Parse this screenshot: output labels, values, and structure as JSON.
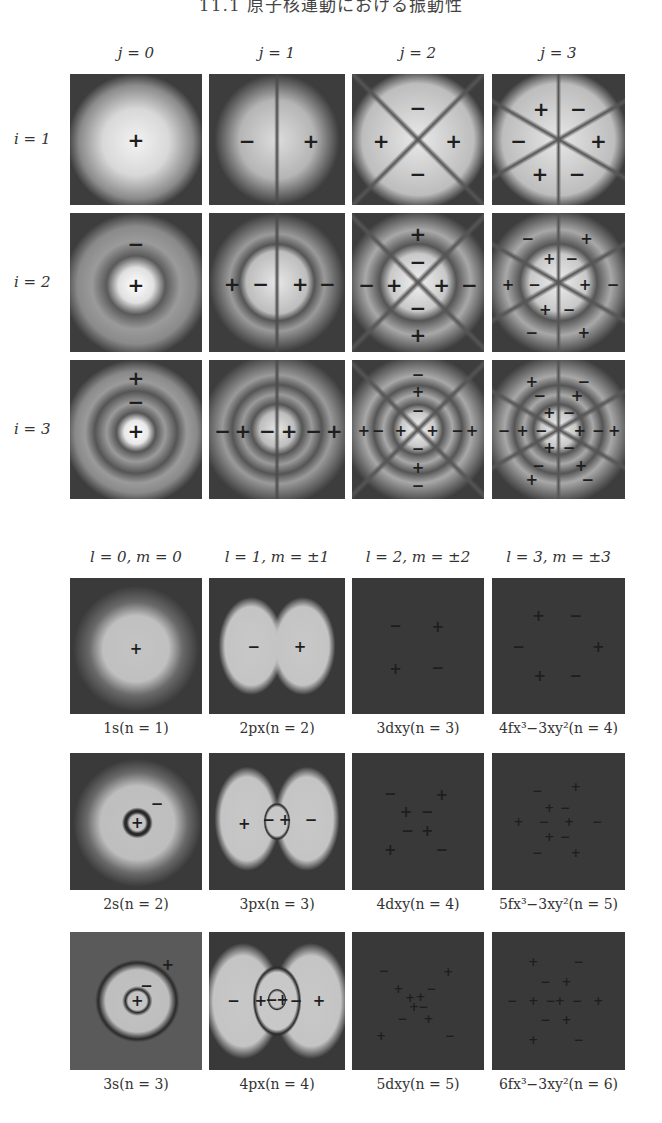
{
  "header": {
    "title": "11.1 原子核運動における振動性"
  },
  "top_section": {
    "columns": [
      "j = 0",
      "j = 1",
      "j = 2",
      "j = 3"
    ],
    "rows": [
      "i = 1",
      "i = 2",
      "i = 3"
    ],
    "panels": [
      [
        {
          "pattern": "j0i1",
          "signs": [
            {
              "s": "+",
              "x": 50,
              "y": 50
            }
          ]
        },
        {
          "pattern": "j1i1",
          "signs": [
            {
              "s": "−",
              "x": 28,
              "y": 51
            },
            {
              "s": "+",
              "x": 75,
              "y": 51
            }
          ]
        },
        {
          "pattern": "j2i1",
          "signs": [
            {
              "s": "−",
              "x": 50,
              "y": 26
            },
            {
              "s": "+",
              "x": 22,
              "y": 51
            },
            {
              "s": "+",
              "x": 77,
              "y": 51
            },
            {
              "s": "−",
              "x": 50,
              "y": 76
            }
          ]
        },
        {
          "pattern": "j3i1",
          "signs": [
            {
              "s": "+",
              "x": 37,
              "y": 27
            },
            {
              "s": "−",
              "x": 65,
              "y": 27
            },
            {
              "s": "−",
              "x": 20,
              "y": 51
            },
            {
              "s": "+",
              "x": 80,
              "y": 51
            },
            {
              "s": "+",
              "x": 36,
              "y": 76
            },
            {
              "s": "−",
              "x": 64,
              "y": 76
            }
          ]
        }
      ],
      [
        {
          "pattern": "j0i2",
          "signs": [
            {
              "s": "−",
              "x": 50,
              "y": 22
            },
            {
              "s": "+",
              "x": 50,
              "y": 52
            }
          ]
        },
        {
          "pattern": "j1i2",
          "signs": [
            {
              "s": "+",
              "x": 17,
              "y": 51
            },
            {
              "s": "−",
              "x": 38,
              "y": 51
            },
            {
              "s": "+",
              "x": 67,
              "y": 51
            },
            {
              "s": "−",
              "x": 87,
              "y": 51
            }
          ]
        },
        {
          "pattern": "j2i2",
          "signs": [
            {
              "s": "+",
              "x": 50,
              "y": 15
            },
            {
              "s": "−",
              "x": 50,
              "y": 35
            },
            {
              "s": "−",
              "x": 11,
              "y": 52
            },
            {
              "s": "+",
              "x": 32,
              "y": 52
            },
            {
              "s": "+",
              "x": 68,
              "y": 52
            },
            {
              "s": "−",
              "x": 89,
              "y": 52
            },
            {
              "s": "−",
              "x": 50,
              "y": 68
            },
            {
              "s": "+",
              "x": 50,
              "y": 88
            }
          ]
        },
        {
          "pattern": "j3i2",
          "signs": [
            {
              "s": "−",
              "x": 27,
              "y": 19
            },
            {
              "s": "+",
              "x": 71,
              "y": 19
            },
            {
              "s": "+",
              "x": 43,
              "y": 33
            },
            {
              "s": "−",
              "x": 60,
              "y": 33
            },
            {
              "s": "+",
              "x": 12,
              "y": 52
            },
            {
              "s": "−",
              "x": 32,
              "y": 52
            },
            {
              "s": "+",
              "x": 70,
              "y": 52
            },
            {
              "s": "−",
              "x": 91,
              "y": 52
            },
            {
              "s": "+",
              "x": 40,
              "y": 70
            },
            {
              "s": "−",
              "x": 58,
              "y": 70
            },
            {
              "s": "−",
              "x": 30,
              "y": 86
            },
            {
              "s": "+",
              "x": 69,
              "y": 86
            }
          ]
        }
      ],
      [
        {
          "pattern": "j0i3",
          "signs": [
            {
              "s": "+",
              "x": 50,
              "y": 13
            },
            {
              "s": "−",
              "x": 50,
              "y": 30
            },
            {
              "s": "+",
              "x": 50,
              "y": 51
            }
          ]
        },
        {
          "pattern": "j1i3",
          "signs": [
            {
              "s": "−",
              "x": 10,
              "y": 51
            },
            {
              "s": "+",
              "x": 25,
              "y": 51
            },
            {
              "s": "−",
              "x": 43,
              "y": 51
            },
            {
              "s": "+",
              "x": 59,
              "y": 51
            },
            {
              "s": "−",
              "x": 77,
              "y": 51
            },
            {
              "s": "+",
              "x": 92,
              "y": 51
            }
          ]
        },
        {
          "pattern": "j3i2b",
          "signs": [
            {
              "s": "−",
              "x": 50,
              "y": 11
            },
            {
              "s": "+",
              "x": 50,
              "y": 23
            },
            {
              "s": "−",
              "x": 50,
              "y": 37
            },
            {
              "s": "+",
              "x": 9,
              "y": 51
            },
            {
              "s": "−",
              "x": 20,
              "y": 51
            },
            {
              "s": "+",
              "x": 37,
              "y": 51
            },
            {
              "s": "+",
              "x": 61,
              "y": 51
            },
            {
              "s": "−",
              "x": 80,
              "y": 51
            },
            {
              "s": "+",
              "x": 91,
              "y": 51
            },
            {
              "s": "−",
              "x": 50,
              "y": 64
            },
            {
              "s": "+",
              "x": 50,
              "y": 78
            },
            {
              "s": "−",
              "x": 50,
              "y": 91
            }
          ]
        },
        {
          "pattern": "j3i3",
          "signs": [
            {
              "s": "+",
              "x": 30,
              "y": 16
            },
            {
              "s": "−",
              "x": 69,
              "y": 16
            },
            {
              "s": "−",
              "x": 36,
              "y": 26
            },
            {
              "s": "+",
              "x": 64,
              "y": 26
            },
            {
              "s": "+",
              "x": 43,
              "y": 38
            },
            {
              "s": "−",
              "x": 58,
              "y": 38
            },
            {
              "s": "−",
              "x": 9,
              "y": 51
            },
            {
              "s": "+",
              "x": 23,
              "y": 51
            },
            {
              "s": "−",
              "x": 37,
              "y": 51
            },
            {
              "s": "+",
              "x": 66,
              "y": 51
            },
            {
              "s": "−",
              "x": 80,
              "y": 51
            },
            {
              "s": "+",
              "x": 92,
              "y": 51
            },
            {
              "s": "+",
              "x": 43,
              "y": 63
            },
            {
              "s": "−",
              "x": 58,
              "y": 63
            },
            {
              "s": "−",
              "x": 35,
              "y": 76
            },
            {
              "s": "+",
              "x": 67,
              "y": 76
            },
            {
              "s": "+",
              "x": 30,
              "y": 86
            },
            {
              "s": "−",
              "x": 72,
              "y": 86
            }
          ]
        }
      ]
    ]
  },
  "bottom_section": {
    "columns": [
      "l = 0,  m = 0",
      "l = 1,  m = ±1",
      "l = 2,  m = ±2",
      "l = 3,  m = ±3"
    ],
    "rows": [
      [
        {
          "caption": "1s(n = 1)",
          "pattern": "s1",
          "signs": [
            {
              "s": "+",
              "x": 50,
              "y": 52
            }
          ]
        },
        {
          "caption": "2px(n = 2)",
          "pattern": "p1",
          "signs": [
            {
              "s": "−",
              "x": 33,
              "y": 51
            },
            {
              "s": "+",
              "x": 67,
              "y": 51
            }
          ]
        },
        {
          "caption": "3dxy(n = 3)",
          "pattern": "d1",
          "signs": [
            {
              "s": "−",
              "x": 33,
              "y": 35
            },
            {
              "s": "+",
              "x": 65,
              "y": 36
            },
            {
              "s": "+",
              "x": 33,
              "y": 67
            },
            {
              "s": "−",
              "x": 65,
              "y": 66
            }
          ]
        },
        {
          "caption": "4fx³−3xy²(n = 4)",
          "pattern": "f1",
          "signs": [
            {
              "s": "+",
              "x": 35,
              "y": 28
            },
            {
              "s": "−",
              "x": 63,
              "y": 28
            },
            {
              "s": "−",
              "x": 20,
              "y": 51
            },
            {
              "s": "+",
              "x": 80,
              "y": 51
            },
            {
              "s": "+",
              "x": 36,
              "y": 72
            },
            {
              "s": "−",
              "x": 63,
              "y": 72
            }
          ]
        }
      ],
      [
        {
          "caption": "2s(n = 2)",
          "pattern": "s2",
          "signs": [
            {
              "s": "−",
              "x": 66,
              "y": 37
            },
            {
              "s": "+",
              "x": 51,
              "y": 51
            }
          ]
        },
        {
          "caption": "3px(n = 3)",
          "pattern": "p2",
          "signs": [
            {
              "s": "+",
              "x": 26,
              "y": 52
            },
            {
              "s": "−",
              "x": 44,
              "y": 49
            },
            {
              "s": "+",
              "x": 56,
              "y": 49
            },
            {
              "s": "−",
              "x": 75,
              "y": 49
            }
          ]
        },
        {
          "caption": "4dxy(n = 4)",
          "pattern": "d2",
          "signs": [
            {
              "s": "−",
              "x": 29,
              "y": 30
            },
            {
              "s": "+",
              "x": 68,
              "y": 31
            },
            {
              "s": "+",
              "x": 41,
              "y": 43
            },
            {
              "s": "−",
              "x": 57,
              "y": 43
            },
            {
              "s": "−",
              "x": 42,
              "y": 57
            },
            {
              "s": "+",
              "x": 57,
              "y": 57
            },
            {
              "s": "+",
              "x": 29,
              "y": 71
            },
            {
              "s": "−",
              "x": 68,
              "y": 71
            }
          ]
        },
        {
          "caption": "5fx³−3xy²(n = 5)",
          "pattern": "f2",
          "signs": [
            {
              "s": "−",
              "x": 34,
              "y": 28
            },
            {
              "s": "+",
              "x": 63,
              "y": 25
            },
            {
              "s": "+",
              "x": 43,
              "y": 40
            },
            {
              "s": "−",
              "x": 55,
              "y": 40
            },
            {
              "s": "+",
              "x": 20,
              "y": 50
            },
            {
              "s": "−",
              "x": 39,
              "y": 50
            },
            {
              "s": "+",
              "x": 58,
              "y": 50
            },
            {
              "s": "−",
              "x": 79,
              "y": 50
            },
            {
              "s": "+",
              "x": 43,
              "y": 61
            },
            {
              "s": "−",
              "x": 55,
              "y": 61
            },
            {
              "s": "−",
              "x": 34,
              "y": 73
            },
            {
              "s": "+",
              "x": 63,
              "y": 73
            }
          ]
        }
      ],
      [
        {
          "caption": "3s(n = 3)",
          "pattern": "s3",
          "signs": [
            {
              "s": "+",
              "x": 74,
              "y": 24
            },
            {
              "s": "−",
              "x": 58,
              "y": 39
            },
            {
              "s": "+",
              "x": 51,
              "y": 50
            }
          ]
        },
        {
          "caption": "4px(n = 4)",
          "pattern": "p3",
          "signs": [
            {
              "s": "−",
              "x": 18,
              "y": 50
            },
            {
              "s": "+",
              "x": 38,
              "y": 50
            },
            {
              "s": "−",
              "x": 46,
              "y": 49
            },
            {
              "s": "+",
              "x": 54,
              "y": 49
            },
            {
              "s": "−",
              "x": 64,
              "y": 50
            },
            {
              "s": "+",
              "x": 81,
              "y": 50
            }
          ]
        },
        {
          "caption": "5dxy(n = 5)",
          "pattern": "d3",
          "signs": [
            {
              "s": "−",
              "x": 24,
              "y": 28
            },
            {
              "s": "+",
              "x": 73,
              "y": 29
            },
            {
              "s": "+",
              "x": 35,
              "y": 41
            },
            {
              "s": "−",
              "x": 60,
              "y": 41
            },
            {
              "s": "+",
              "x": 44,
              "y": 48
            },
            {
              "s": "+",
              "x": 52,
              "y": 47
            },
            {
              "s": "+",
              "x": 47,
              "y": 54
            },
            {
              "s": "−",
              "x": 54,
              "y": 54
            },
            {
              "s": "−",
              "x": 38,
              "y": 63
            },
            {
              "s": "+",
              "x": 58,
              "y": 63
            },
            {
              "s": "+",
              "x": 22,
              "y": 75
            },
            {
              "s": "−",
              "x": 74,
              "y": 75
            }
          ]
        },
        {
          "caption": "6fx³−3xy²(n = 6)",
          "pattern": "f3",
          "signs": [
            {
              "s": "+",
              "x": 31,
              "y": 22
            },
            {
              "s": "−",
              "x": 65,
              "y": 22
            },
            {
              "s": "−",
              "x": 40,
              "y": 36
            },
            {
              "s": "+",
              "x": 56,
              "y": 36
            },
            {
              "s": "−",
              "x": 15,
              "y": 50
            },
            {
              "s": "+",
              "x": 31,
              "y": 50
            },
            {
              "s": "−",
              "x": 44,
              "y": 50
            },
            {
              "s": "+",
              "x": 51,
              "y": 50
            },
            {
              "s": "−",
              "x": 64,
              "y": 50
            },
            {
              "s": "+",
              "x": 80,
              "y": 50
            },
            {
              "s": "−",
              "x": 40,
              "y": 64
            },
            {
              "s": "+",
              "x": 56,
              "y": 64
            },
            {
              "s": "+",
              "x": 31,
              "y": 78
            },
            {
              "s": "−",
              "x": 65,
              "y": 78
            }
          ]
        }
      ]
    ]
  }
}
